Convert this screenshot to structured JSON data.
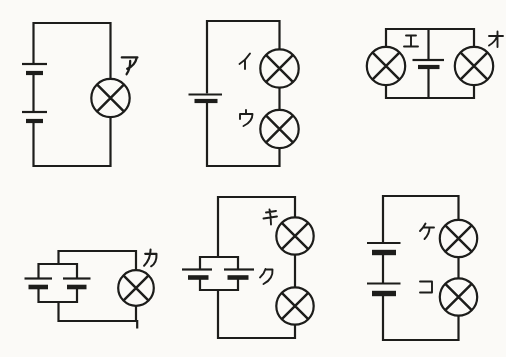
{
  "canvas": {
    "background": "#fbfaf7",
    "ink": "#1d1d1b",
    "width": 506,
    "height": 357
  },
  "circuits": [
    {
      "name": "circuit-a",
      "layout": "two batteries in series, one lamp",
      "lamps": [
        {
          "label": "ア"
        }
      ]
    },
    {
      "name": "circuit-b",
      "layout": "one battery, two lamps in series",
      "lamps": [
        {
          "label": "イ"
        },
        {
          "label": "ウ"
        }
      ]
    },
    {
      "name": "circuit-c",
      "layout": "one battery, two lamps in parallel",
      "lamps": [
        {
          "label": "エ"
        },
        {
          "label": "オ"
        }
      ]
    },
    {
      "name": "circuit-d",
      "layout": "two batteries in parallel, one lamp",
      "lamps": [
        {
          "label": "カ"
        }
      ]
    },
    {
      "name": "circuit-e",
      "layout": "two batteries in parallel, two lamps in series",
      "lamps": [
        {
          "label": "キ"
        },
        {
          "label": "ク"
        }
      ]
    },
    {
      "name": "circuit-f",
      "layout": "two batteries in series, two lamps in series",
      "lamps": [
        {
          "label": "ケ"
        },
        {
          "label": "コ"
        }
      ]
    }
  ]
}
